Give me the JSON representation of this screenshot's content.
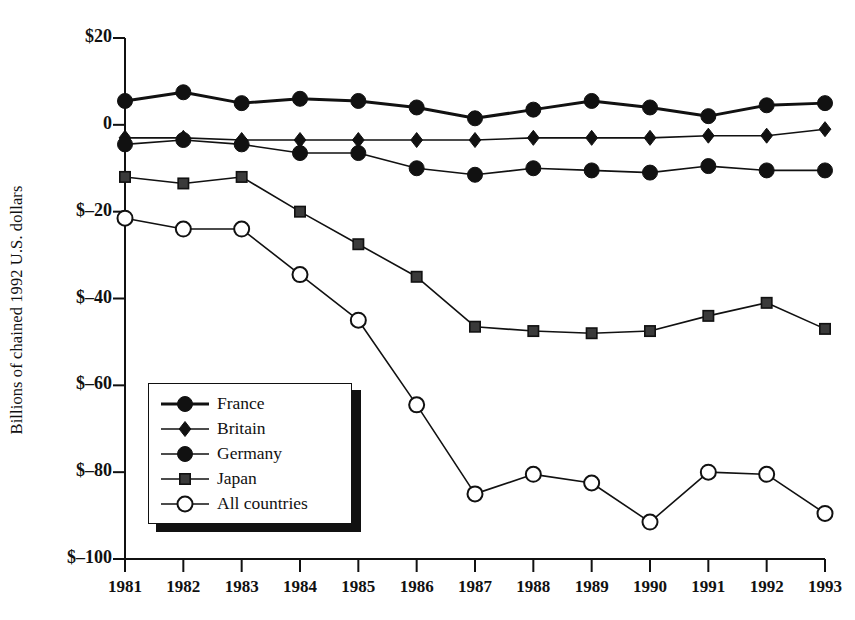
{
  "chart_data": {
    "type": "line",
    "title": "",
    "xlabel": "",
    "ylabel": "Billions of chained 1992 U.S. dollars",
    "categories": [
      "1981",
      "1982",
      "1983",
      "1984",
      "1985",
      "1986",
      "1987",
      "1988",
      "1989",
      "1990",
      "1991",
      "1992",
      "1993"
    ],
    "x": [
      1981,
      1982,
      1983,
      1984,
      1985,
      1986,
      1987,
      1988,
      1989,
      1990,
      1991,
      1992,
      1993
    ],
    "xlim": [
      1980.5,
      1993.5
    ],
    "ylim": [
      -100,
      20
    ],
    "yticks": [
      20,
      0,
      -20,
      -40,
      -60,
      -80,
      -100
    ],
    "ytick_labels": [
      "$20",
      "0",
      "$–20",
      "$–40",
      "$–60",
      "$–80",
      "$–100"
    ],
    "grid": false,
    "legend_position": "lower-left-inside",
    "series": [
      {
        "name": "France",
        "marker": "filled-circle",
        "line_width": 3,
        "values": [
          5.5,
          7.5,
          5.0,
          6.0,
          5.5,
          4.0,
          1.5,
          3.5,
          5.5,
          4.0,
          2.0,
          4.5,
          5.0
        ]
      },
      {
        "name": "Britain",
        "marker": "filled-diamond",
        "line_width": 1.6,
        "values": [
          -3.0,
          -3.0,
          -3.5,
          -3.5,
          -3.5,
          -3.5,
          -3.5,
          -3.0,
          -3.0,
          -3.0,
          -2.5,
          -2.5,
          -1.0
        ]
      },
      {
        "name": "Germany",
        "marker": "filled-circle",
        "line_width": 1.6,
        "values": [
          -4.5,
          -3.5,
          -4.5,
          -6.5,
          -6.5,
          -10.0,
          -11.5,
          -10.0,
          -10.5,
          -11.0,
          -9.5,
          -10.5,
          -10.5
        ]
      },
      {
        "name": "Japan",
        "marker": "filled-square",
        "line_width": 1.6,
        "values": [
          -12.0,
          -13.5,
          -12.0,
          -20.0,
          -27.5,
          -35.0,
          -46.5,
          -47.5,
          -48.0,
          -47.5,
          -44.0,
          -41.0,
          -47.0
        ]
      },
      {
        "name": "All countries",
        "marker": "open-circle",
        "line_width": 1.6,
        "values": [
          -21.5,
          -24.0,
          -24.0,
          -34.5,
          -45.0,
          -64.5,
          -85.0,
          -80.5,
          -82.5,
          -91.5,
          -80.0,
          -80.5,
          -89.5
        ]
      }
    ]
  },
  "legend": {
    "items": [
      {
        "label": "France"
      },
      {
        "label": "Britain"
      },
      {
        "label": "Germany"
      },
      {
        "label": "Japan"
      },
      {
        "label": "All countries"
      }
    ]
  }
}
